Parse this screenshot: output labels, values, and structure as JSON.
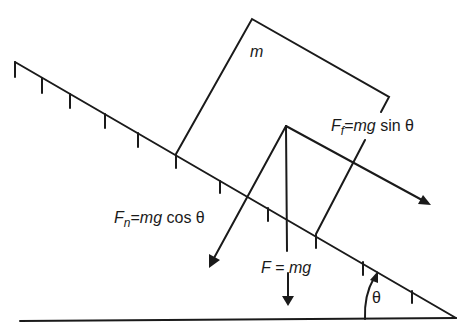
{
  "diagram": {
    "colors": {
      "stroke": "#1a1a1a",
      "background": "#ffffff"
    },
    "labels": {
      "mass": "m",
      "friction": {
        "symbol": "F",
        "subscript": "f",
        "equals": "=",
        "expr_italic": "mg",
        "expr_rest": " sin θ"
      },
      "normal": {
        "symbol": "F",
        "subscript": "n",
        "equals": "=",
        "expr_italic": "mg",
        "expr_rest": " cos θ"
      },
      "gravity": {
        "symbol": "F",
        "equals": " = ",
        "expr_italic": "mg"
      },
      "angle": "θ"
    },
    "elements": [
      "inclined-plane",
      "ground-line",
      "block",
      "normal-force-arrow",
      "gravity-force-line",
      "gravity-force-arrow",
      "friction-force-arrow",
      "angle-arc"
    ]
  }
}
